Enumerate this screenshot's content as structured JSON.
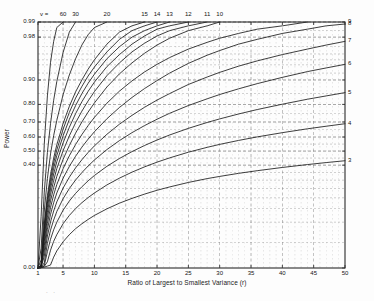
{
  "figure": {
    "background_color": "#fdfdfd",
    "frame_color": "#2b2b2b",
    "curve_color": "#1b1b1b",
    "grid_color": "#555555",
    "artifact_marks": ". ."
  },
  "axes": {
    "x_title": "Ratio of Largest to Smallest Variance (r)",
    "y_title": "Power",
    "x_ticks": [
      "1",
      "5",
      "10",
      "15",
      "20",
      "25",
      "30",
      "35",
      "40",
      "45",
      "50"
    ],
    "x_tick_values": [
      1,
      5,
      10,
      15,
      20,
      25,
      30,
      35,
      40,
      45,
      50
    ],
    "y_ticks": [
      "0.00",
      "0.40",
      "0.50",
      "0.60",
      "0.70",
      "0.80",
      "0.90",
      "0.98",
      "0.99"
    ],
    "y_tick_values": [
      0.0,
      0.4,
      0.5,
      0.6,
      0.7,
      0.8,
      0.9,
      0.98,
      0.99
    ],
    "y_minor_values": [
      0.05,
      0.1,
      0.15,
      0.2,
      0.25,
      0.3,
      0.35,
      0.45,
      0.55,
      0.65,
      0.75,
      0.85,
      0.92,
      0.94,
      0.95,
      0.96,
      0.97,
      0.985
    ],
    "x_minor_values": [
      2,
      3,
      4,
      6,
      7,
      8,
      9,
      11,
      12,
      13,
      14,
      16,
      17,
      18,
      19,
      21,
      22,
      23,
      24,
      26,
      27,
      28,
      29,
      31,
      32,
      33,
      34,
      36,
      37,
      38,
      39,
      41,
      42,
      43,
      44,
      46,
      47,
      48,
      49
    ],
    "x_limits": [
      1,
      50
    ],
    "y_limits": [
      0.0,
      0.99
    ],
    "y_scale": "normal-probability",
    "grid": "dashed both axes"
  },
  "legend": {
    "parameter_symbol": "v =",
    "top_labels": [
      "60",
      "30",
      "20",
      "15",
      "14",
      "13",
      "12",
      "11",
      "10"
    ],
    "top_label_v": [
      60,
      30,
      20,
      15,
      14,
      13,
      12,
      11,
      10
    ],
    "right_labels": [
      "9",
      "8",
      "7",
      "6",
      "5",
      "4",
      "3"
    ],
    "right_label_v": [
      9,
      8,
      7,
      6,
      5,
      4,
      3
    ]
  },
  "chart_data": {
    "type": "line",
    "title": "",
    "subtitle": "",
    "xlabel": "Ratio of Largest to Smallest Variance (r)",
    "ylabel": "Power",
    "xlim": [
      1,
      50
    ],
    "ylim": [
      0.0,
      0.99
    ],
    "yscale": "probability",
    "grid": true,
    "legend_position": "curve-end-labels (top and right margins)",
    "x_ticks": [
      1,
      5,
      10,
      15,
      20,
      25,
      30,
      35,
      40,
      45,
      50
    ],
    "y_ticks": [
      0.0,
      0.4,
      0.5,
      0.6,
      0.7,
      0.8,
      0.9,
      0.98,
      0.99
    ],
    "annotations": [
      "v =",
      "60",
      "30",
      "20",
      "15",
      "14",
      "13",
      "12",
      "11",
      "10",
      "9",
      "8",
      "7",
      "6",
      "5",
      "4",
      "3"
    ],
    "x": [
      1,
      1.5,
      2,
      2.5,
      3,
      3.5,
      4,
      5,
      6,
      7,
      8,
      9,
      10,
      12,
      14,
      16,
      18,
      20,
      22,
      25,
      28,
      30,
      33,
      36,
      40,
      44,
      47,
      50
    ],
    "series": [
      {
        "name": "v = 60",
        "values": [
          0.0,
          0.12,
          0.55,
          0.84,
          0.945,
          0.976,
          0.987,
          0.99,
          0.99,
          0.99,
          0.99,
          0.99,
          0.99,
          0.99,
          0.99,
          0.99,
          0.99,
          0.99,
          0.99,
          0.99,
          0.99,
          0.99,
          0.99,
          0.99,
          0.99,
          0.99,
          0.99,
          0.99
        ]
      },
      {
        "name": "v = 30",
        "values": [
          0.0,
          0.04,
          0.23,
          0.49,
          0.69,
          0.82,
          0.895,
          0.962,
          0.984,
          0.99,
          0.99,
          0.99,
          0.99,
          0.99,
          0.99,
          0.99,
          0.99,
          0.99,
          0.99,
          0.99,
          0.99,
          0.99,
          0.99,
          0.99,
          0.99,
          0.99,
          0.99,
          0.99
        ]
      },
      {
        "name": "v = 20",
        "values": [
          0.0,
          0.025,
          0.14,
          0.31,
          0.48,
          0.61,
          0.71,
          0.845,
          0.915,
          0.952,
          0.972,
          0.982,
          0.987,
          0.99,
          0.99,
          0.99,
          0.99,
          0.99,
          0.99,
          0.99,
          0.99,
          0.99,
          0.99,
          0.99,
          0.99,
          0.99,
          0.99,
          0.99
        ]
      },
      {
        "name": "v = 15",
        "values": [
          0.0,
          0.018,
          0.095,
          0.21,
          0.335,
          0.45,
          0.545,
          0.69,
          0.79,
          0.857,
          0.9,
          0.93,
          0.95,
          0.973,
          0.984,
          0.988,
          0.99,
          0.99,
          0.99,
          0.99,
          0.99,
          0.99,
          0.99,
          0.99,
          0.99,
          0.99,
          0.99,
          0.99
        ]
      },
      {
        "name": "v = 14",
        "values": [
          0.0,
          0.016,
          0.086,
          0.192,
          0.305,
          0.415,
          0.508,
          0.652,
          0.757,
          0.83,
          0.878,
          0.912,
          0.935,
          0.963,
          0.978,
          0.985,
          0.988,
          0.99,
          0.99,
          0.99,
          0.99,
          0.99,
          0.99,
          0.99,
          0.99,
          0.99,
          0.99,
          0.99
        ]
      },
      {
        "name": "v = 13",
        "values": [
          0.0,
          0.015,
          0.078,
          0.174,
          0.277,
          0.379,
          0.468,
          0.608,
          0.716,
          0.794,
          0.85,
          0.889,
          0.917,
          0.952,
          0.97,
          0.98,
          0.985,
          0.988,
          0.99,
          0.99,
          0.99,
          0.99,
          0.99,
          0.99,
          0.99,
          0.99,
          0.99,
          0.99
        ]
      },
      {
        "name": "v = 12",
        "values": [
          0.0,
          0.014,
          0.07,
          0.155,
          0.248,
          0.34,
          0.424,
          0.558,
          0.666,
          0.75,
          0.813,
          0.859,
          0.893,
          0.936,
          0.959,
          0.973,
          0.981,
          0.986,
          0.988,
          0.99,
          0.99,
          0.99,
          0.99,
          0.99,
          0.99,
          0.99,
          0.99,
          0.99
        ]
      },
      {
        "name": "v = 11",
        "values": [
          0.0,
          0.012,
          0.061,
          0.135,
          0.217,
          0.299,
          0.376,
          0.502,
          0.608,
          0.695,
          0.764,
          0.817,
          0.858,
          0.913,
          0.944,
          0.963,
          0.974,
          0.981,
          0.985,
          0.988,
          0.99,
          0.99,
          0.99,
          0.99,
          0.99,
          0.99,
          0.99,
          0.99
        ]
      },
      {
        "name": "v = 10",
        "values": [
          0.0,
          0.011,
          0.052,
          0.115,
          0.185,
          0.256,
          0.324,
          0.44,
          0.54,
          0.627,
          0.7,
          0.759,
          0.807,
          0.876,
          0.918,
          0.944,
          0.961,
          0.972,
          0.979,
          0.985,
          0.988,
          0.99,
          0.99,
          0.99,
          0.99,
          0.99,
          0.99,
          0.99
        ]
      },
      {
        "name": "v = 9",
        "values": [
          0.0,
          0.01,
          0.044,
          0.096,
          0.155,
          0.215,
          0.273,
          0.375,
          0.466,
          0.547,
          0.617,
          0.677,
          0.728,
          0.806,
          0.86,
          0.897,
          0.923,
          0.941,
          0.954,
          0.967,
          0.975,
          0.979,
          0.983,
          0.986,
          0.988,
          0.99,
          0.99,
          0.99
        ]
      },
      {
        "name": "v = 8",
        "values": [
          0.0,
          0.008,
          0.036,
          0.079,
          0.127,
          0.176,
          0.225,
          0.312,
          0.391,
          0.463,
          0.528,
          0.585,
          0.636,
          0.72,
          0.784,
          0.833,
          0.87,
          0.898,
          0.92,
          0.943,
          0.958,
          0.965,
          0.973,
          0.978,
          0.983,
          0.986,
          0.988,
          0.989
        ]
      },
      {
        "name": "v = 7",
        "values": [
          0.0,
          0.007,
          0.029,
          0.063,
          0.101,
          0.14,
          0.18,
          0.252,
          0.319,
          0.381,
          0.438,
          0.49,
          0.537,
          0.619,
          0.686,
          0.74,
          0.785,
          0.821,
          0.85,
          0.885,
          0.909,
          0.922,
          0.937,
          0.948,
          0.959,
          0.967,
          0.972,
          0.976
        ]
      },
      {
        "name": "v = 6",
        "values": [
          0.0,
          0.005,
          0.022,
          0.048,
          0.077,
          0.107,
          0.138,
          0.195,
          0.25,
          0.301,
          0.349,
          0.394,
          0.436,
          0.511,
          0.575,
          0.63,
          0.677,
          0.717,
          0.752,
          0.794,
          0.827,
          0.846,
          0.869,
          0.888,
          0.908,
          0.924,
          0.933,
          0.941
        ]
      },
      {
        "name": "v = 5",
        "values": [
          0.0,
          0.004,
          0.016,
          0.035,
          0.056,
          0.078,
          0.1,
          0.143,
          0.184,
          0.223,
          0.26,
          0.296,
          0.33,
          0.392,
          0.447,
          0.496,
          0.54,
          0.579,
          0.614,
          0.659,
          0.697,
          0.719,
          0.748,
          0.773,
          0.801,
          0.825,
          0.84,
          0.854
        ]
      },
      {
        "name": "v = 4",
        "values": [
          0.0,
          0.003,
          0.011,
          0.023,
          0.037,
          0.052,
          0.066,
          0.095,
          0.123,
          0.15,
          0.176,
          0.201,
          0.225,
          0.271,
          0.313,
          0.352,
          0.388,
          0.421,
          0.451,
          0.492,
          0.527,
          0.548,
          0.576,
          0.601,
          0.63,
          0.656,
          0.673,
          0.689
        ]
      },
      {
        "name": "v = 3",
        "values": [
          0.0,
          0.002,
          0.006,
          0.013,
          0.02,
          0.028,
          0.036,
          0.051,
          0.066,
          0.081,
          0.095,
          0.109,
          0.123,
          0.149,
          0.174,
          0.197,
          0.219,
          0.24,
          0.259,
          0.286,
          0.31,
          0.324,
          0.344,
          0.362,
          0.384,
          0.404,
          0.418,
          0.431
        ]
      }
    ]
  }
}
